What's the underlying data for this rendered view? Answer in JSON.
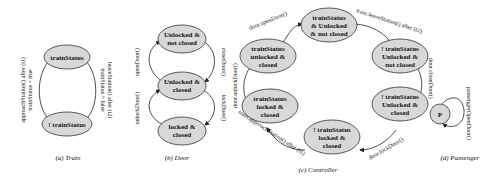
{
  "figures": {
    "train": {
      "caption": "(a) Train",
      "states": [
        "trainStatus",
        "! trainStatus"
      ],
      "transitions": [
        {
          "from": "! trainStatus",
          "to": "trainStatus",
          "label1": "approachStation() after (t1)",
          "label2": "trainStatus = true"
        },
        {
          "from": "trainStatus",
          "to": "! trainStatus",
          "label1": "leaveStation() after (t2)",
          "label2": "trainStatus = false"
        }
      ]
    },
    "door": {
      "caption": "(b) Door",
      "states": [
        {
          "line1": "Unlocked &",
          "line2": "not closed"
        },
        {
          "line1": "Unlocked &",
          "line2": "closed"
        },
        {
          "line1": "locked &",
          "line2": "closed"
        }
      ],
      "transitions": {
        "openDoor": "openDoor()",
        "closeDoor": "closeDoor()",
        "unlockDoor": "unlockDoor()",
        "lockDoor": "lockDoor()"
      }
    },
    "controller": {
      "caption": "(c) Controller",
      "states": [
        {
          "line1": "trainStatus",
          "line2": "& Unlocked",
          "line3": "& not closed"
        },
        {
          "line1": "! trainStatus",
          "line2": "Unlocked &",
          "line3": "not closed"
        },
        {
          "line1": "! trainStatus",
          "line2": "Unlocked &",
          "line3": "closed"
        },
        {
          "line1": "! trainStatus",
          "line2": "locked &",
          "line3": "closed"
        },
        {
          "line1": "trainStatus",
          "line2": "locked &",
          "line3": "closed"
        },
        {
          "line1": "trainStatus",
          "line2": "unlocked &",
          "line3": "closed"
        }
      ],
      "transitions": {
        "openDoor": "door.openDoor()",
        "leaveStation": "train.leaveStation() after (t2)",
        "closeDoor": "door.closeDoor()",
        "lockDoor": "door.lockDoor()",
        "approachStation": "train.approachStation() after (t1)",
        "unlockDoor": "door.unlockDoor()"
      }
    },
    "passenger": {
      "caption": "(d) Passenger",
      "state": "P",
      "transition": "passengerOpenDoor()"
    }
  }
}
